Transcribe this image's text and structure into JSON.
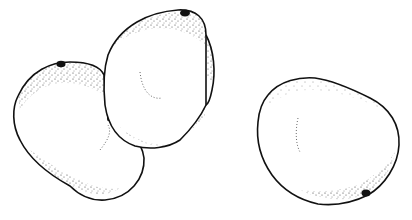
{
  "illustration": {
    "subject": "Three stippled fruits (mangoes) line drawing",
    "style": "black ink outline with stipple shading on white",
    "colors": {
      "background": "#ffffff",
      "ink": "#111111"
    },
    "fruits": [
      {
        "name": "left-fruit",
        "stem_position": "top"
      },
      {
        "name": "middle-fruit",
        "stem_position": "top-right"
      },
      {
        "name": "right-fruit",
        "stem_position": "bottom-right"
      }
    ]
  }
}
